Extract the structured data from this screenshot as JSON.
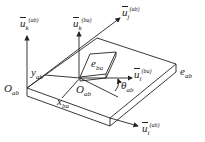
{
  "diagram": {
    "type": "coordinate-frame-schematic",
    "labels": {
      "u_k_ab": {
        "base": "u",
        "sub": "k",
        "sup": "(ab)"
      },
      "u_k_ba": {
        "base": "u",
        "sub": "k",
        "sup": "(ba)"
      },
      "u_j_ab": {
        "base": "u",
        "sub": "j",
        "sup": "(ab)"
      },
      "u_i_ba": {
        "base": "u",
        "sub": "i",
        "sup": "(ba)"
      },
      "u_i_ab": {
        "base": "u",
        "sub": "i",
        "sup": "(ab)"
      },
      "e_ba": {
        "base": "e",
        "sub": "ba"
      },
      "e_ab": {
        "base": "e",
        "sub": "ab"
      },
      "O_ab_left": {
        "base": "O",
        "sub": "ab"
      },
      "O_ab_center": {
        "base": "O",
        "sub": "ab"
      },
      "y_ab": {
        "base": "y",
        "sub": "ab"
      },
      "x_ba": {
        "base": "x",
        "sub": "ba"
      },
      "theta_ab": {
        "base": "θ",
        "sub": "ab"
      }
    },
    "colors": {
      "stroke": "#222222",
      "background": "#ffffff"
    }
  }
}
